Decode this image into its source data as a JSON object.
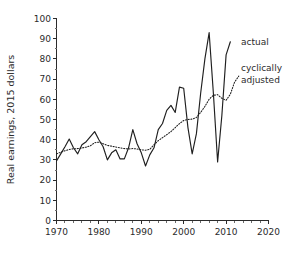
{
  "chart_data": {
    "type": "line",
    "title": "",
    "xlabel": "",
    "ylabel": "Real earnings, 2015 dollars",
    "xlim": [
      1970,
      2020
    ],
    "ylim": [
      0,
      100
    ],
    "grid": false,
    "legend_position": "right-inside",
    "x_ticks": [
      1970,
      1980,
      1990,
      2000,
      2010,
      2020
    ],
    "x_tick_labels": [
      "1970",
      "1980",
      "1990",
      "2000",
      "2010",
      "2020"
    ],
    "x_minor_tick_step": 2,
    "y_ticks": [
      0,
      10,
      20,
      30,
      40,
      50,
      60,
      70,
      80,
      90,
      100
    ],
    "y_tick_labels": [
      "0",
      "10",
      "20",
      "30",
      "40",
      "50",
      "60",
      "70",
      "80",
      "90",
      "100"
    ],
    "series": [
      {
        "name": "actual",
        "style": "solid",
        "color": "#1f1f1f",
        "x": [
          1970,
          1971,
          1972,
          1973,
          1974,
          1975,
          1976,
          1977,
          1978,
          1979,
          1980,
          1981,
          1982,
          1983,
          1984,
          1985,
          1986,
          1987,
          1988,
          1989,
          1990,
          1991,
          1992,
          1993,
          1994,
          1995,
          1996,
          1997,
          1998,
          1999,
          2000,
          2001,
          2002,
          2003,
          2004,
          2005,
          2006,
          2007,
          2008,
          2009,
          2010,
          2011
        ],
        "values": [
          29.5,
          33.0,
          36.5,
          40.3,
          36.0,
          33.0,
          37.5,
          39.0,
          41.5,
          44.0,
          40.0,
          36.5,
          30.0,
          33.5,
          35.0,
          30.5,
          30.5,
          36.0,
          45.0,
          38.0,
          33.5,
          27.0,
          32.5,
          36.0,
          45.0,
          48.0,
          54.5,
          57.0,
          53.5,
          66.0,
          65.5,
          46.0,
          33.0,
          43.0,
          63.0,
          80.0,
          93.0,
          63.0,
          29.0,
          52.0,
          82.0,
          88.5
        ]
      },
      {
        "name": "cyclically adjusted",
        "style": "dotted",
        "color": "#1f1f1f",
        "x": [
          1970,
          1971,
          1972,
          1973,
          1974,
          1975,
          1976,
          1977,
          1978,
          1979,
          1980,
          1981,
          1982,
          1983,
          1984,
          1985,
          1986,
          1987,
          1988,
          1989,
          1990,
          1991,
          1992,
          1993,
          1994,
          1995,
          1996,
          1997,
          1998,
          1999,
          2000,
          2001,
          2002,
          2003,
          2004,
          2005,
          2006,
          2007,
          2008,
          2009,
          2010,
          2011,
          2012,
          2013
        ],
        "values": [
          33.0,
          33.8,
          34.5,
          35.2,
          35.5,
          35.6,
          35.9,
          36.3,
          37.0,
          38.5,
          38.8,
          38.0,
          37.2,
          36.8,
          36.4,
          36.0,
          35.6,
          35.4,
          35.6,
          35.4,
          35.0,
          34.8,
          35.2,
          37.5,
          39.5,
          41.0,
          42.5,
          44.0,
          46.0,
          48.0,
          49.5,
          50.0,
          50.2,
          51.0,
          53.5,
          56.5,
          60.0,
          62.0,
          62.3,
          60.5,
          59.5,
          62.5,
          68.5,
          71.5
        ]
      }
    ],
    "annotations": [
      {
        "text": "actual",
        "x": 2013.5,
        "y": 87.0
      },
      {
        "text": "cyclically",
        "x": 2013.5,
        "y": 74.0
      },
      {
        "text": "adjusted",
        "x": 2013.5,
        "y": 68.0
      }
    ]
  }
}
